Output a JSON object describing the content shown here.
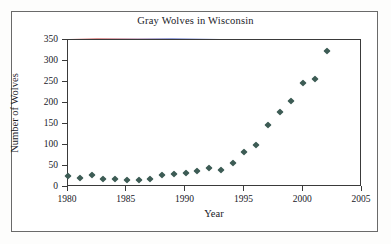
{
  "chart_data": {
    "type": "scatter",
    "title": "Gray Wolves in Wisconsin",
    "xlabel": "Year",
    "ylabel": "Number of Wolves",
    "xlim": [
      1980,
      2005
    ],
    "ylim": [
      0,
      350
    ],
    "xticks": [
      1980,
      1985,
      1990,
      1995,
      2000,
      2005
    ],
    "yticks": [
      0,
      50,
      100,
      150,
      200,
      250,
      300,
      350
    ],
    "grid": false,
    "legend": null,
    "marker_color": "#3d5c55",
    "marker_shape": "diamond",
    "x": [
      1980,
      1981,
      1982,
      1983,
      1984,
      1985,
      1986,
      1987,
      1988,
      1989,
      1990,
      1991,
      1992,
      1993,
      1994,
      1995,
      1996,
      1997,
      1998,
      1999,
      2000,
      2001,
      2002
    ],
    "values": [
      26,
      21,
      28,
      20,
      18,
      17,
      16,
      18,
      28,
      31,
      34,
      39,
      45,
      40,
      57,
      83,
      99,
      148,
      178,
      205,
      248,
      257,
      323
    ],
    "series": [
      {
        "name": "Gray Wolves",
        "values": [
          26,
          21,
          28,
          20,
          18,
          17,
          16,
          18,
          28,
          31,
          34,
          39,
          45,
          40,
          57,
          83,
          99,
          148,
          178,
          205,
          248,
          257,
          323
        ]
      }
    ]
  }
}
